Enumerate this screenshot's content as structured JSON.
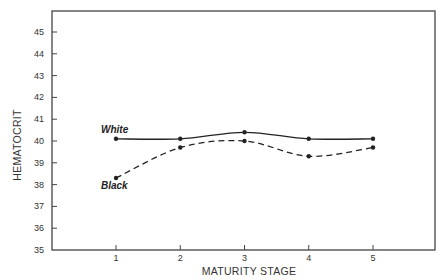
{
  "chart_data": {
    "type": "line",
    "title": "",
    "xlabel": "MATURITY STAGE",
    "ylabel": "HEMATOCRIT",
    "x": [
      1,
      2,
      3,
      4,
      5
    ],
    "x_tick_labels": [
      "1",
      "2",
      "3",
      "4",
      "5"
    ],
    "xlim": [
      0,
      6
    ],
    "ylim": [
      35,
      46
    ],
    "y_ticks": [
      35,
      36,
      37,
      38,
      39,
      40,
      41,
      42,
      43,
      44,
      45
    ],
    "y_tick_labels": [
      "35",
      "36",
      "37",
      "38",
      "39",
      "40",
      "41",
      "42",
      "43",
      "44",
      "45"
    ],
    "grid": false,
    "legend": "inline labels at left of each series",
    "series": [
      {
        "name": "White",
        "label": "White",
        "style": "solid",
        "color": "#222222",
        "values": [
          40.1,
          40.1,
          40.4,
          40.1,
          40.1
        ]
      },
      {
        "name": "Black",
        "label": "Black",
        "style": "dashed",
        "color": "#222222",
        "values": [
          38.3,
          39.7,
          40.0,
          39.3,
          39.7
        ]
      }
    ]
  }
}
